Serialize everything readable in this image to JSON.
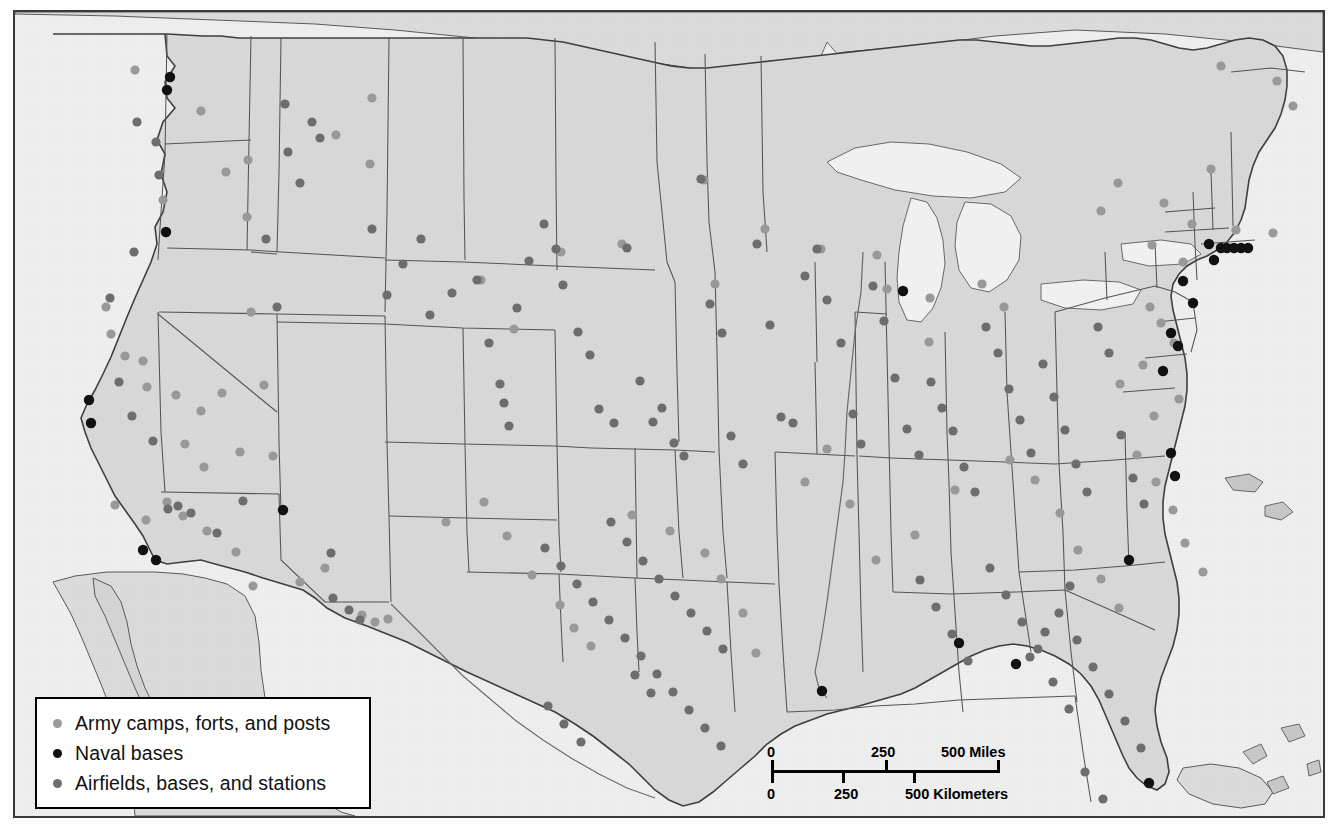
{
  "map": {
    "title": "United States military installations",
    "subject": "Army camps, forts and posts; naval bases; airfields, bases and stations across the continental United States",
    "background_color": "#efefef",
    "land_color": "#d9d9d9",
    "water_color": "#f4f4f4",
    "border_color": "#3a3a3a",
    "state_line_color": "#4a4a4a"
  },
  "legend": {
    "border_color": "#000000",
    "background_color": "#ffffff",
    "items": [
      {
        "label": "Army camps, forts, and posts",
        "color": "#9a9a9a",
        "icon": "circle-marker-icon"
      },
      {
        "label": "Naval bases",
        "color": "#111111",
        "icon": "circle-marker-icon"
      },
      {
        "label": "Airfields, bases, and stations",
        "color": "#6e6e6e",
        "icon": "circle-marker-icon"
      }
    ]
  },
  "scalebar": {
    "miles": {
      "unit": "Miles",
      "ticks": [
        "0",
        "250",
        "500"
      ],
      "label": "500 Miles"
    },
    "kilometers": {
      "unit": "Kilometers",
      "ticks": [
        "0",
        "250",
        "500"
      ],
      "label": "500 Kilometers"
    },
    "miles_zero": "0",
    "miles_mid": "250",
    "miles_max": "500 Miles",
    "km_zero": "0",
    "km_mid": "250",
    "km_max": "500 Kilometers"
  },
  "chart_data": {
    "type": "scatter",
    "projection": "conic (contiguous United States)",
    "legend_position": "bottom-left",
    "grid": false,
    "xlabel": "",
    "ylabel": "",
    "series": [
      {
        "name": "Army camps, forts, and posts",
        "color": "#9a9a9a",
        "marker": "circle",
        "count": 96,
        "points": [
          [
            120,
            58
          ],
          [
            186,
            99
          ],
          [
            211,
            160
          ],
          [
            148,
            188
          ],
          [
            233,
            148
          ],
          [
            232,
            205
          ],
          [
            357,
            86
          ],
          [
            321,
            123
          ],
          [
            355,
            152
          ],
          [
            466,
            268
          ],
          [
            499,
            317
          ],
          [
            607,
            232
          ],
          [
            546,
            240
          ],
          [
            689,
            168
          ],
          [
            700,
            272
          ],
          [
            750,
            217
          ],
          [
            806,
            237
          ],
          [
            862,
            243
          ],
          [
            872,
            277
          ],
          [
            915,
            286
          ],
          [
            967,
            272
          ],
          [
            914,
            330
          ],
          [
            989,
            295
          ],
          [
            1086,
            199
          ],
          [
            1103,
            171
          ],
          [
            1149,
            191
          ],
          [
            1196,
            157
          ],
          [
            1206,
            54
          ],
          [
            1262,
            69
          ],
          [
            1278,
            94
          ],
          [
            1137,
            233
          ],
          [
            1168,
            250
          ],
          [
            1177,
            212
          ],
          [
            1221,
            218
          ],
          [
            1258,
            221
          ],
          [
            1135,
            295
          ],
          [
            1146,
            311
          ],
          [
            1159,
            331
          ],
          [
            1128,
            353
          ],
          [
            1105,
            372
          ],
          [
            1164,
            387
          ],
          [
            1139,
            404
          ],
          [
            91,
            295
          ],
          [
            96,
            322
          ],
          [
            110,
            344
          ],
          [
            128,
            349
          ],
          [
            132,
            375
          ],
          [
            161,
            383
          ],
          [
            186,
            399
          ],
          [
            207,
            381
          ],
          [
            236,
            300
          ],
          [
            249,
            373
          ],
          [
            170,
            432
          ],
          [
            189,
            455
          ],
          [
            225,
            440
          ],
          [
            258,
            444
          ],
          [
            100,
            493
          ],
          [
            131,
            508
          ],
          [
            152,
            490
          ],
          [
            168,
            504
          ],
          [
            192,
            519
          ],
          [
            221,
            540
          ],
          [
            238,
            574
          ],
          [
            285,
            570
          ],
          [
            310,
            556
          ],
          [
            347,
            603
          ],
          [
            360,
            610
          ],
          [
            373,
            607
          ],
          [
            431,
            510
          ],
          [
            469,
            490
          ],
          [
            492,
            524
          ],
          [
            517,
            563
          ],
          [
            545,
            593
          ],
          [
            559,
            616
          ],
          [
            576,
            634
          ],
          [
            617,
            503
          ],
          [
            655,
            519
          ],
          [
            690,
            541
          ],
          [
            706,
            567
          ],
          [
            728,
            601
          ],
          [
            741,
            641
          ],
          [
            790,
            470
          ],
          [
            812,
            437
          ],
          [
            835,
            492
          ],
          [
            861,
            548
          ],
          [
            900,
            523
          ],
          [
            940,
            478
          ],
          [
            995,
            448
          ],
          [
            1020,
            468
          ],
          [
            1045,
            501
          ],
          [
            1063,
            538
          ],
          [
            1086,
            567
          ],
          [
            1104,
            596
          ],
          [
            1122,
            443
          ],
          [
            1141,
            470
          ],
          [
            1158,
            498
          ],
          [
            1170,
            531
          ],
          [
            1188,
            560
          ]
        ]
      },
      {
        "name": "Naval bases",
        "color": "#111111",
        "marker": "circle",
        "count": 27,
        "points": [
          [
            155,
            65
          ],
          [
            152,
            78
          ],
          [
            151,
            220
          ],
          [
            74,
            388
          ],
          [
            76,
            411
          ],
          [
            128,
            538
          ],
          [
            141,
            548
          ],
          [
            268,
            498
          ],
          [
            888,
            279
          ],
          [
            1178,
            291
          ],
          [
            1168,
            269
          ],
          [
            1194,
            232
          ],
          [
            1199,
            248
          ],
          [
            1206,
            236
          ],
          [
            1212,
            236
          ],
          [
            1219,
            236
          ],
          [
            1226,
            236
          ],
          [
            1233,
            236
          ],
          [
            1156,
            321
          ],
          [
            1163,
            334
          ],
          [
            1148,
            359
          ],
          [
            1156,
            441
          ],
          [
            1160,
            464
          ],
          [
            1114,
            548
          ],
          [
            944,
            631
          ],
          [
            1001,
            652
          ],
          [
            807,
            679
          ],
          [
            1134,
            771
          ]
        ]
      },
      {
        "name": "Airfields, bases, and stations",
        "color": "#6e6e6e",
        "marker": "circle",
        "count": 140,
        "points": [
          [
            122,
            110
          ],
          [
            141,
            130
          ],
          [
            144,
            163
          ],
          [
            119,
            240
          ],
          [
            95,
            286
          ],
          [
            104,
            370
          ],
          [
            117,
            404
          ],
          [
            138,
            429
          ],
          [
            153,
            497
          ],
          [
            163,
            494
          ],
          [
            176,
            501
          ],
          [
            202,
            521
          ],
          [
            228,
            489
          ],
          [
            251,
            227
          ],
          [
            262,
            295
          ],
          [
            270,
            92
          ],
          [
            273,
            140
          ],
          [
            285,
            171
          ],
          [
            297,
            110
          ],
          [
            305,
            126
          ],
          [
            316,
            541
          ],
          [
            318,
            586
          ],
          [
            334,
            598
          ],
          [
            345,
            608
          ],
          [
            357,
            217
          ],
          [
            372,
            283
          ],
          [
            388,
            252
          ],
          [
            406,
            227
          ],
          [
            415,
            303
          ],
          [
            437,
            281
          ],
          [
            462,
            268
          ],
          [
            474,
            331
          ],
          [
            485,
            372
          ],
          [
            489,
            391
          ],
          [
            494,
            414
          ],
          [
            502,
            296
          ],
          [
            514,
            249
          ],
          [
            529,
            212
          ],
          [
            541,
            237
          ],
          [
            548,
            273
          ],
          [
            563,
            320
          ],
          [
            575,
            343
          ],
          [
            584,
            397
          ],
          [
            599,
            411
          ],
          [
            612,
            236
          ],
          [
            625,
            369
          ],
          [
            638,
            410
          ],
          [
            647,
            396
          ],
          [
            659,
            431
          ],
          [
            669,
            444
          ],
          [
            686,
            167
          ],
          [
            695,
            292
          ],
          [
            707,
            321
          ],
          [
            716,
            424
          ],
          [
            728,
            452
          ],
          [
            742,
            232
          ],
          [
            755,
            313
          ],
          [
            766,
            405
          ],
          [
            778,
            411
          ],
          [
            790,
            264
          ],
          [
            802,
            237
          ],
          [
            812,
            288
          ],
          [
            826,
            331
          ],
          [
            838,
            402
          ],
          [
            846,
            432
          ],
          [
            858,
            274
          ],
          [
            869,
            309
          ],
          [
            880,
            366
          ],
          [
            892,
            417
          ],
          [
            904,
            443
          ],
          [
            916,
            370
          ],
          [
            927,
            396
          ],
          [
            938,
            419
          ],
          [
            949,
            455
          ],
          [
            960,
            480
          ],
          [
            971,
            315
          ],
          [
            983,
            341
          ],
          [
            994,
            377
          ],
          [
            1005,
            408
          ],
          [
            1016,
            441
          ],
          [
            1028,
            352
          ],
          [
            1039,
            385
          ],
          [
            1050,
            418
          ],
          [
            1061,
            452
          ],
          [
            1072,
            480
          ],
          [
            1083,
            315
          ],
          [
            1094,
            341
          ],
          [
            1106,
            423
          ],
          [
            1118,
            466
          ],
          [
            1129,
            492
          ],
          [
            596,
            510
          ],
          [
            612,
            530
          ],
          [
            628,
            549
          ],
          [
            644,
            567
          ],
          [
            660,
            584
          ],
          [
            676,
            601
          ],
          [
            692,
            619
          ],
          [
            708,
            637
          ],
          [
            620,
            663
          ],
          [
            636,
            681
          ],
          [
            530,
            536
          ],
          [
            546,
            554
          ],
          [
            562,
            572
          ],
          [
            578,
            590
          ],
          [
            594,
            608
          ],
          [
            610,
            626
          ],
          [
            626,
            644
          ],
          [
            642,
            662
          ],
          [
            658,
            680
          ],
          [
            674,
            698
          ],
          [
            690,
            716
          ],
          [
            706,
            734
          ],
          [
            533,
            694
          ],
          [
            549,
            712
          ],
          [
            566,
            730
          ],
          [
            1055,
            574
          ],
          [
            1044,
            601
          ],
          [
            1062,
            628
          ],
          [
            1078,
            655
          ],
          [
            1094,
            682
          ],
          [
            1110,
            709
          ],
          [
            1126,
            736
          ],
          [
            1070,
            760
          ],
          [
            1088,
            787
          ],
          [
            1030,
            620
          ],
          [
            1015,
            645
          ],
          [
            1038,
            670
          ],
          [
            1054,
            697
          ],
          [
            975,
            556
          ],
          [
            991,
            583
          ],
          [
            1007,
            610
          ],
          [
            1023,
            637
          ],
          [
            905,
            568
          ],
          [
            921,
            595
          ],
          [
            937,
            622
          ],
          [
            953,
            649
          ]
        ]
      }
    ]
  }
}
